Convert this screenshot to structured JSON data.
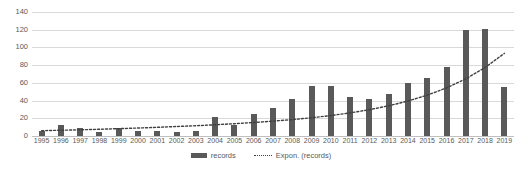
{
  "chart_data": {
    "type": "bar",
    "title": "",
    "xlabel": "",
    "ylabel": "",
    "ylim": [
      0,
      140
    ],
    "ytick_step": 20,
    "yticks": [
      0,
      20,
      40,
      60,
      80,
      100,
      120,
      140
    ],
    "grid": true,
    "legend_position": "bottom",
    "categories": [
      "1995",
      "1996",
      "1997",
      "1998",
      "1999",
      "2000",
      "2001",
      "2002",
      "2003",
      "2004",
      "2005",
      "2006",
      "2007",
      "2008",
      "2009",
      "2010",
      "2011",
      "2012",
      "2013",
      "2014",
      "2015",
      "2016",
      "2017",
      "2018",
      "2019"
    ],
    "series": [
      {
        "name": "records",
        "type": "bar",
        "color": "#595959",
        "values": [
          6,
          13,
          9,
          4,
          9,
          6,
          6,
          4,
          6,
          22,
          13,
          25,
          32,
          42,
          57,
          57,
          44,
          42,
          47,
          60,
          65,
          78,
          120,
          121,
          55
        ]
      },
      {
        "name": "Expon. (records)",
        "type": "trendline",
        "style": "dotted",
        "color": "#404040",
        "values": [
          6.0,
          6.5,
          7.0,
          7.6,
          8.3,
          9.0,
          9.8,
          10.7,
          11.6,
          12.7,
          13.9,
          15.2,
          16.8,
          18.5,
          20.6,
          23.1,
          26.1,
          29.7,
          34.1,
          39.5,
          46.1,
          54.3,
          64.5,
          77.3,
          93.3
        ]
      }
    ]
  },
  "legend": {
    "items": [
      {
        "label": "records",
        "marker": "bar-swatch"
      },
      {
        "label": "Expon. (records)",
        "marker": "dotted-line-swatch"
      }
    ]
  },
  "colors": {
    "bar": "#595959",
    "trendline": "#404040",
    "gridline": "#d9d9d9",
    "axis": "#bfbfbf",
    "text": "#595959",
    "background": "#ffffff"
  }
}
